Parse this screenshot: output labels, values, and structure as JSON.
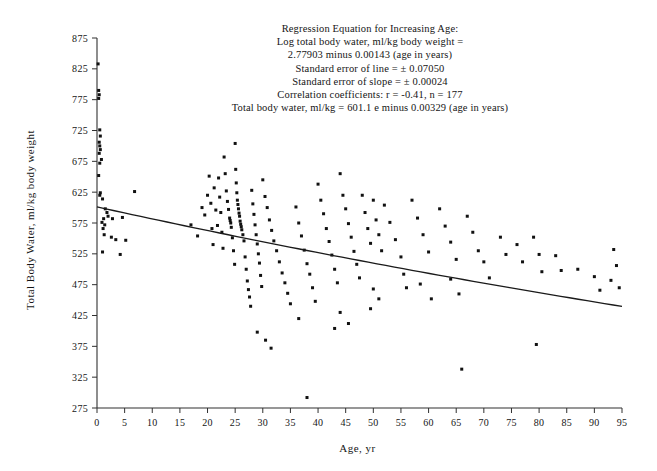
{
  "figure": {
    "background": "#ffffff",
    "ink_color": "#151515"
  },
  "annotation": {
    "lines": [
      "Regression Equation for Increasing Age:",
      "Log total body water, ml/kg body weight =",
      "2.77903 minus 0.00143 (age in years)",
      "Standard error of line = ± 0.07050",
      "Standard error of slope = ± 0.00024",
      "Correlation coefficients:  r = -0.41,  n = 177",
      "Total body water, ml/kg = 601.1 e minus 0.00329 (age in years)"
    ]
  },
  "chart_data": {
    "type": "scatter",
    "title": "",
    "xlabel": "Age, yr",
    "ylabel": "Total Body Water, ml/kg body weight",
    "xlim": [
      0,
      95
    ],
    "ylim": [
      275,
      875
    ],
    "xticks": [
      0,
      5,
      10,
      15,
      20,
      25,
      30,
      35,
      40,
      45,
      50,
      55,
      60,
      65,
      70,
      75,
      80,
      85,
      90,
      95
    ],
    "yticks": [
      275,
      325,
      375,
      425,
      475,
      525,
      575,
      625,
      675,
      725,
      775,
      825,
      875
    ],
    "grid": false,
    "legend": null,
    "marker": "square",
    "marker_size_px": 3,
    "n_points": 177,
    "correlation_r": -0.41,
    "regression": {
      "form": "log10(TBW) = 2.77903 - 0.00143 * age",
      "exponential_form": "TBW = 601.1 * e^(-0.00329 * age)",
      "intercept_log10": 2.77903,
      "slope_log10": -0.00143,
      "standard_error_line": 0.0705,
      "standard_error_slope": 0.00024,
      "amplitude": 601.1,
      "decay_rate": 0.00329,
      "x_start": 0,
      "y_start": 601.1,
      "x_end": 95,
      "y_end": 440.0
    },
    "points": [
      [
        0.2,
        833
      ],
      [
        0.3,
        790
      ],
      [
        0.4,
        783
      ],
      [
        0.3,
        777
      ],
      [
        0.5,
        726
      ],
      [
        0.6,
        716
      ],
      [
        0.4,
        706
      ],
      [
        0.5,
        700
      ],
      [
        0.6,
        694
      ],
      [
        0.4,
        688
      ],
      [
        0.8,
        678
      ],
      [
        0.5,
        672
      ],
      [
        0.3,
        652
      ],
      [
        0.6,
        624
      ],
      [
        0.5,
        620
      ],
      [
        1.0,
        614
      ],
      [
        1.5,
        598
      ],
      [
        1.8,
        592
      ],
      [
        2.0,
        586
      ],
      [
        1.2,
        582
      ],
      [
        0.9,
        576
      ],
      [
        1.4,
        572
      ],
      [
        1.1,
        566
      ],
      [
        1.3,
        556
      ],
      [
        2.6,
        552
      ],
      [
        3.4,
        548
      ],
      [
        5.2,
        547
      ],
      [
        6.8,
        626
      ],
      [
        2.8,
        582
      ],
      [
        4.6,
        584
      ],
      [
        1.0,
        528
      ],
      [
        4.2,
        524
      ],
      [
        17.0,
        572
      ],
      [
        18.2,
        554
      ],
      [
        19.0,
        600
      ],
      [
        19.5,
        588
      ],
      [
        20.0,
        620
      ],
      [
        20.3,
        651
      ],
      [
        20.6,
        607
      ],
      [
        20.8,
        566
      ],
      [
        21.0,
        540
      ],
      [
        21.2,
        632
      ],
      [
        21.5,
        596
      ],
      [
        21.8,
        571
      ],
      [
        22.0,
        648
      ],
      [
        22.2,
        617
      ],
      [
        22.4,
        592
      ],
      [
        22.6,
        560
      ],
      [
        22.8,
        534
      ],
      [
        23.0,
        682
      ],
      [
        23.2,
        655
      ],
      [
        23.4,
        627
      ],
      [
        23.6,
        610
      ],
      [
        23.8,
        597
      ],
      [
        24.0,
        583
      ],
      [
        24.1,
        579
      ],
      [
        24.2,
        575
      ],
      [
        24.3,
        568
      ],
      [
        24.5,
        551
      ],
      [
        24.7,
        530
      ],
      [
        24.9,
        508
      ],
      [
        25.0,
        704
      ],
      [
        25.1,
        662
      ],
      [
        25.2,
        640
      ],
      [
        25.3,
        624
      ],
      [
        25.4,
        612
      ],
      [
        25.5,
        605
      ],
      [
        25.6,
        598
      ],
      [
        25.7,
        591
      ],
      [
        25.8,
        586
      ],
      [
        25.9,
        578
      ],
      [
        26.0,
        573
      ],
      [
        26.1,
        569
      ],
      [
        26.2,
        564
      ],
      [
        26.4,
        556
      ],
      [
        26.6,
        546
      ],
      [
        26.8,
        520
      ],
      [
        27.0,
        500
      ],
      [
        27.2,
        481
      ],
      [
        27.4,
        467
      ],
      [
        27.6,
        455
      ],
      [
        27.8,
        440
      ],
      [
        28.0,
        628
      ],
      [
        28.2,
        606
      ],
      [
        28.4,
        589
      ],
      [
        28.6,
        572
      ],
      [
        28.8,
        556
      ],
      [
        29.0,
        541
      ],
      [
        29.2,
        525
      ],
      [
        29.4,
        510
      ],
      [
        29.6,
        490
      ],
      [
        29.8,
        472
      ],
      [
        30.0,
        645
      ],
      [
        30.4,
        618
      ],
      [
        30.8,
        600
      ],
      [
        31.2,
        580
      ],
      [
        31.6,
        563
      ],
      [
        32.0,
        546
      ],
      [
        32.5,
        530
      ],
      [
        33.0,
        512
      ],
      [
        33.5,
        494
      ],
      [
        34.0,
        478
      ],
      [
        34.5,
        461
      ],
      [
        35.0,
        444
      ],
      [
        30.5,
        385
      ],
      [
        31.5,
        372
      ],
      [
        29.0,
        398
      ],
      [
        36.0,
        601
      ],
      [
        36.5,
        575
      ],
      [
        37.0,
        554
      ],
      [
        37.5,
        531
      ],
      [
        38.0,
        509
      ],
      [
        38.5,
        492
      ],
      [
        39.0,
        470
      ],
      [
        39.5,
        448
      ],
      [
        38.0,
        292
      ],
      [
        36.5,
        420
      ],
      [
        40.0,
        638
      ],
      [
        40.5,
        612
      ],
      [
        41.0,
        590
      ],
      [
        41.5,
        566
      ],
      [
        42.0,
        545
      ],
      [
        42.5,
        523
      ],
      [
        43.0,
        500
      ],
      [
        43.5,
        478
      ],
      [
        44.0,
        655
      ],
      [
        44.5,
        620
      ],
      [
        45.0,
        598
      ],
      [
        45.5,
        574
      ],
      [
        46.0,
        552
      ],
      [
        46.5,
        529
      ],
      [
        47.0,
        508
      ],
      [
        47.5,
        486
      ],
      [
        44.0,
        430
      ],
      [
        45.5,
        412
      ],
      [
        43.0,
        404
      ],
      [
        48.0,
        620
      ],
      [
        48.5,
        592
      ],
      [
        49.0,
        566
      ],
      [
        49.5,
        542
      ],
      [
        50.0,
        612
      ],
      [
        50.5,
        580
      ],
      [
        51.0,
        556
      ],
      [
        51.5,
        530
      ],
      [
        50.0,
        468
      ],
      [
        51.0,
        452
      ],
      [
        49.5,
        436
      ],
      [
        52.0,
        604
      ],
      [
        53.0,
        576
      ],
      [
        54.0,
        548
      ],
      [
        55.0,
        520
      ],
      [
        55.5,
        492
      ],
      [
        56.0,
        470
      ],
      [
        57.0,
        612
      ],
      [
        58.0,
        583
      ],
      [
        59.0,
        556
      ],
      [
        60.0,
        528
      ],
      [
        58.5,
        476
      ],
      [
        60.5,
        452
      ],
      [
        62.0,
        598
      ],
      [
        63.0,
        570
      ],
      [
        64.0,
        544
      ],
      [
        65.0,
        516
      ],
      [
        64.0,
        484
      ],
      [
        65.5,
        460
      ],
      [
        66.0,
        338
      ],
      [
        67.0,
        586
      ],
      [
        68.0,
        560
      ],
      [
        69.0,
        530
      ],
      [
        70.0,
        512
      ],
      [
        71.0,
        486
      ],
      [
        73.0,
        552
      ],
      [
        74.0,
        524
      ],
      [
        76.0,
        540
      ],
      [
        77.0,
        512
      ],
      [
        79.0,
        552
      ],
      [
        80.0,
        524
      ],
      [
        80.5,
        496
      ],
      [
        79.5,
        378
      ],
      [
        83.0,
        522
      ],
      [
        84.0,
        498
      ],
      [
        87.0,
        500
      ],
      [
        90.0,
        488
      ],
      [
        91.0,
        466
      ],
      [
        93.5,
        532
      ],
      [
        94.0,
        506
      ],
      [
        93.0,
        482
      ],
      [
        94.5,
        470
      ]
    ]
  }
}
